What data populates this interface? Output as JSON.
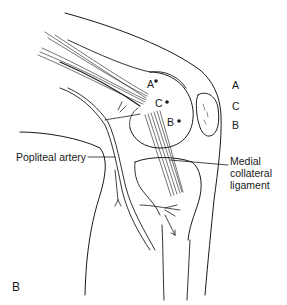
{
  "figure": {
    "panel_label": "B",
    "labels": {
      "point_a": "A",
      "point_c": "C",
      "point_b": "B",
      "side_a": "A",
      "side_c": "C",
      "side_b": "B",
      "popliteal_artery": "Popliteal artery",
      "mcl_line1": "Medial",
      "mcl_line2": "collateral",
      "mcl_line3": "ligament"
    },
    "colors": {
      "ink": "#1a1a1a",
      "background": "#ffffff"
    }
  }
}
